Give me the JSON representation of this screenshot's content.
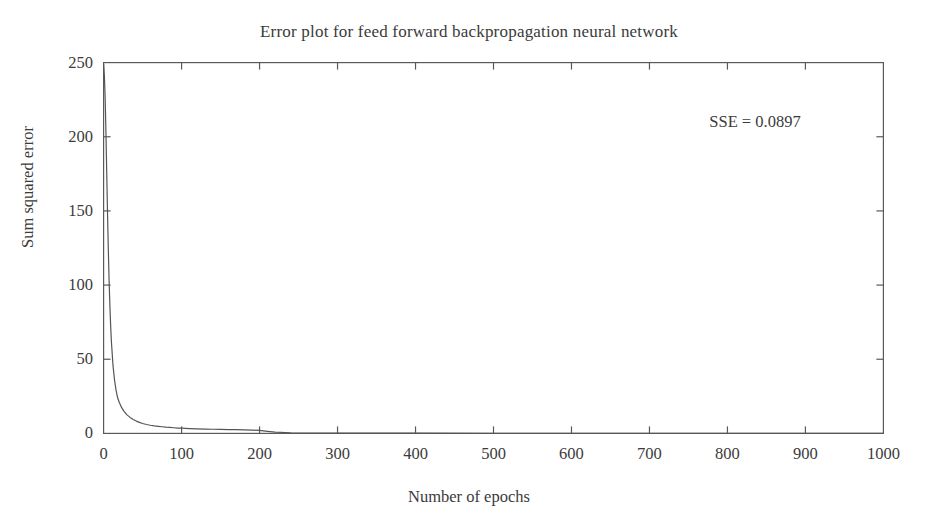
{
  "chart_data": {
    "type": "line",
    "title": "Error plot for feed forward backpropagation neural network",
    "xlabel": "Number of epochs",
    "ylabel": "Sum squared error",
    "xlim": [
      0,
      1000
    ],
    "ylim": [
      0,
      250
    ],
    "xticks": [
      0,
      100,
      200,
      300,
      400,
      500,
      600,
      700,
      800,
      900,
      1000
    ],
    "yticks": [
      0,
      50,
      100,
      150,
      200,
      250
    ],
    "xtick_labels": [
      "0",
      "100",
      "200",
      "300",
      "400",
      "500",
      "600",
      "700",
      "800",
      "900",
      "1000"
    ],
    "ytick_labels": [
      "0",
      "50",
      "100",
      "150",
      "200",
      "250"
    ],
    "grid": false,
    "legend": null,
    "box": true,
    "tick_direction": "in",
    "annotations": [
      {
        "name": "sse-value",
        "text": "SSE  =  0.0897",
        "x": 830,
        "y": 212
      }
    ],
    "series": [
      {
        "name": "Sum squared error",
        "color": "#555555",
        "line_width": 1.2,
        "x": [
          0,
          1,
          2,
          3,
          4,
          5,
          6,
          7,
          8,
          9,
          10,
          12,
          14,
          16,
          18,
          20,
          23,
          26,
          30,
          34,
          38,
          42,
          46,
          50,
          55,
          60,
          65,
          70,
          75,
          80,
          85,
          90,
          95,
          100,
          110,
          120,
          130,
          140,
          150,
          160,
          170,
          180,
          190,
          200,
          210,
          220,
          240,
          260,
          300,
          350,
          400,
          500,
          600,
          700,
          800,
          900,
          1000
        ],
        "y": [
          249,
          241,
          226,
          203,
          176,
          149,
          125,
          104,
          87,
          73,
          62,
          46,
          36,
          29,
          24,
          21,
          17.5,
          15,
          12.5,
          10.8,
          9.4,
          8.3,
          7.4,
          6.7,
          6.0,
          5.5,
          5.1,
          4.8,
          4.5,
          4.2,
          4.0,
          3.8,
          3.6,
          3.5,
          3.2,
          3.0,
          2.9,
          2.8,
          2.7,
          2.6,
          2.5,
          2.4,
          2.2,
          2.0,
          1.4,
          0.9,
          0.45,
          0.28,
          0.18,
          0.14,
          0.12,
          0.11,
          0.105,
          0.1,
          0.095,
          0.092,
          0.0897
        ]
      }
    ]
  }
}
